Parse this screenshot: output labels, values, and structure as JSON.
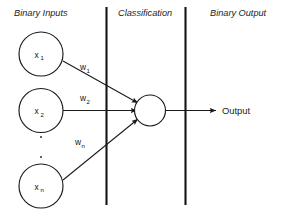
{
  "diagram": {
    "background_color": "#ffffff",
    "stroke_color": "#1a1a1a",
    "headers": {
      "inputs": "Binary Inputs",
      "classification": "Classification",
      "output": "Binary Output"
    },
    "input_nodes": [
      {
        "base": "x",
        "sub": "1"
      },
      {
        "base": "x",
        "sub": "2"
      },
      {
        "base": "x",
        "sub": "n"
      }
    ],
    "weights": [
      {
        "base": "w",
        "sub": "1"
      },
      {
        "base": "w",
        "sub": "2"
      },
      {
        "base": "w",
        "sub": "n"
      }
    ],
    "classifier_node": {
      "label": ""
    },
    "output": {
      "label": "Output"
    },
    "ellipsis": {
      "dots": 2,
      "character": "."
    }
  }
}
